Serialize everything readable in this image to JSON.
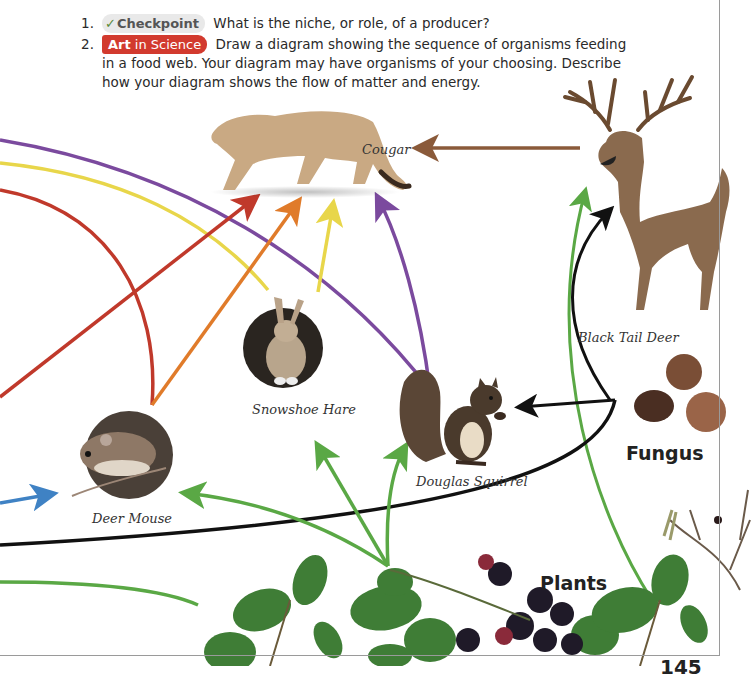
{
  "questions": [
    {
      "number": "1.",
      "badge": {
        "icon": "checkmark-icon",
        "label": "Checkpoint"
      },
      "text": "What is the niche, or role, of a producer?"
    },
    {
      "number": "2.",
      "badge": {
        "strong": "Art",
        "label": " in Science"
      },
      "text": "Draw a diagram showing the sequence of organisms feeding in a food web. Your diagram may have organisms of your choosing. Describe how your diagram shows the flow of matter and energy."
    }
  ],
  "food_web": {
    "organisms": [
      {
        "id": "cougar",
        "label": "Cougar"
      },
      {
        "id": "black-tail-deer",
        "label": "Black Tail Deer"
      },
      {
        "id": "snowshoe-hare",
        "label": "Snowshoe Hare"
      },
      {
        "id": "douglas-squirrel",
        "label": "Douglas Squirrel"
      },
      {
        "id": "deer-mouse",
        "label": "Deer Mouse"
      }
    ],
    "groups": {
      "fungus": "Fungus",
      "plants": "Plants"
    },
    "arrow_colors": {
      "red": "#c0392b",
      "yellow": "#e8d64a",
      "purple": "#7b4a9e",
      "green": "#5aa845",
      "black": "#111111",
      "blue": "#3f82c4",
      "orange": "#e07b2a",
      "brown": "#8a5a3a"
    }
  },
  "page": {
    "number": "145"
  }
}
